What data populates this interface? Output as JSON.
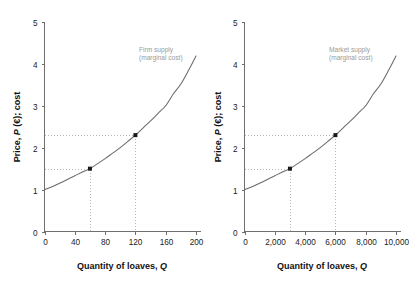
{
  "figure": {
    "background_color": "#ffffff",
    "curve_color": "#6b6b6b",
    "axis_color": "#6e6e6e",
    "guide_color": "#b8b8b8",
    "marker_color": "#1a1a1a",
    "annotation_color": "#9a9a9a"
  },
  "chart_data": [
    {
      "type": "line",
      "panel": "left",
      "title": "",
      "xlabel": "Quantity of loaves, Q",
      "ylabel": "Price, P (€); cost",
      "xlim": [
        0,
        200
      ],
      "ylim": [
        0,
        5
      ],
      "grid": false,
      "legend_position": "inline-annotation",
      "x_ticks": [
        0,
        40,
        80,
        120,
        160,
        200
      ],
      "x_tick_labels": [
        "0",
        "40",
        "80",
        "120",
        "160",
        "200"
      ],
      "y_ticks": [
        0,
        1,
        2,
        3,
        4,
        5
      ],
      "y_tick_labels": [
        "0",
        "1",
        "2",
        "3",
        "4",
        "5"
      ],
      "annotations": [
        {
          "text_line1": "Firm supply",
          "text_line2": "(marginal cost)",
          "x": 118,
          "y": 4.42
        }
      ],
      "series": [
        {
          "name": "Firm supply (marginal cost)",
          "x": [
            0,
            10,
            20,
            30,
            40,
            50,
            60,
            70,
            80,
            90,
            100,
            110,
            120,
            130,
            140,
            150,
            160,
            170,
            180,
            190,
            200
          ],
          "values": [
            1.0,
            1.07,
            1.15,
            1.24,
            1.33,
            1.42,
            1.5,
            1.62,
            1.74,
            1.87,
            2.0,
            2.15,
            2.3,
            2.47,
            2.64,
            2.82,
            3.0,
            3.28,
            3.52,
            3.84,
            4.19
          ]
        }
      ],
      "points": [
        {
          "label": "point-a",
          "x": 60,
          "y": 1.5
        },
        {
          "label": "point-b",
          "x": 120,
          "y": 2.3
        }
      ],
      "guide_lines": [
        {
          "from_axis": "y",
          "value": 1.5,
          "to_x": 60
        },
        {
          "from_axis": "y",
          "value": 2.3,
          "to_x": 120
        },
        {
          "from_axis": "x",
          "value": 60,
          "to_y": 1.5
        },
        {
          "from_axis": "x",
          "value": 120,
          "to_y": 2.3
        }
      ]
    },
    {
      "type": "line",
      "panel": "right",
      "title": "",
      "xlabel": "Quantity of loaves, Q",
      "ylabel": "Price, P (€); cost",
      "xlim": [
        0,
        10000
      ],
      "ylim": [
        0,
        5
      ],
      "grid": false,
      "legend_position": "inline-annotation",
      "x_ticks": [
        0,
        2000,
        4000,
        6000,
        8000,
        10000
      ],
      "x_tick_labels": [
        "0",
        "2,000",
        "4,000",
        "6,000",
        "8,000",
        "10,000"
      ],
      "y_ticks": [
        0,
        1,
        2,
        3,
        4,
        5
      ],
      "y_tick_labels": [
        "0",
        "1",
        "2",
        "3",
        "4",
        "5"
      ],
      "annotations": [
        {
          "text_line1": "Market supply",
          "text_line2": "(marginal cost)",
          "x": 5900,
          "y": 4.42
        }
      ],
      "series": [
        {
          "name": "Market supply (marginal cost)",
          "x": [
            0,
            500,
            1000,
            1500,
            2000,
            2500,
            3000,
            3500,
            4000,
            4500,
            5000,
            5500,
            6000,
            6500,
            7000,
            7500,
            8000,
            8500,
            9000,
            9500,
            10000
          ],
          "values": [
            1.0,
            1.07,
            1.15,
            1.24,
            1.33,
            1.42,
            1.5,
            1.62,
            1.74,
            1.87,
            2.0,
            2.15,
            2.3,
            2.47,
            2.64,
            2.82,
            3.0,
            3.28,
            3.52,
            3.84,
            4.19
          ]
        }
      ],
      "points": [
        {
          "label": "point-a",
          "x": 3000,
          "y": 1.5
        },
        {
          "label": "point-b",
          "x": 6000,
          "y": 2.3
        }
      ],
      "guide_lines": [
        {
          "from_axis": "y",
          "value": 1.5,
          "to_x": 3000
        },
        {
          "from_axis": "y",
          "value": 2.3,
          "to_x": 6000
        },
        {
          "from_axis": "x",
          "value": 3000,
          "to_y": 1.5
        },
        {
          "from_axis": "x",
          "value": 6000,
          "to_y": 2.3
        }
      ]
    }
  ]
}
